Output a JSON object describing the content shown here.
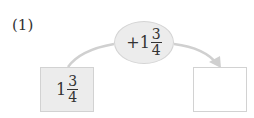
{
  "problem": {
    "label": "(1)",
    "operation": {
      "sign": "+",
      "whole": "1",
      "numerator": "3",
      "denominator": "4"
    },
    "start": {
      "whole": "1",
      "numerator": "3",
      "denominator": "4"
    },
    "result": {
      "value": ""
    }
  },
  "colors": {
    "fill": "#ececec",
    "border": "#d2d2d2",
    "arrow": "#d0d0d0",
    "text": "#333333"
  }
}
